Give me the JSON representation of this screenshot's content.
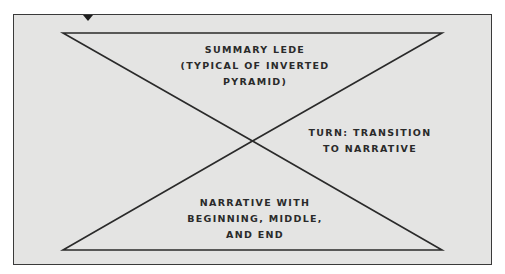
{
  "diagram": {
    "colors": {
      "background": "#e4e4e3",
      "line": "#2a2a2a",
      "text": "#2a2a2a"
    },
    "shapes": {
      "top_triangle": "inverted pyramid",
      "bottom_triangle": "pyramid",
      "marker": "down-triangle-marker"
    },
    "labels": {
      "top": "Summary lede\n(typical of inverted\npyramid)",
      "turn": "Turn: transition\nto narrative",
      "bottom": "Narrative with\nbeginning, middle,\nand end"
    }
  }
}
